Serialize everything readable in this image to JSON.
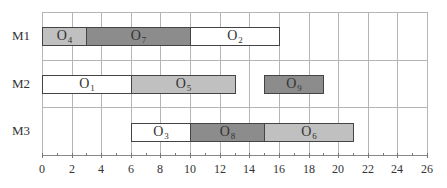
{
  "chart_data": {
    "type": "gantt",
    "title": "",
    "xlabel": "",
    "ylabel": "",
    "xlim": [
      0,
      26
    ],
    "x_ticks": [
      0,
      2,
      4,
      6,
      8,
      10,
      12,
      14,
      16,
      18,
      20,
      22,
      24,
      26
    ],
    "grid": true,
    "rows": [
      "M1",
      "M2",
      "M3"
    ],
    "tasks": [
      {
        "row": "M1",
        "op": "O",
        "sub": "4",
        "start": 0,
        "end": 3,
        "color": "#c0c0c0"
      },
      {
        "row": "M1",
        "op": "O",
        "sub": "7",
        "start": 3,
        "end": 10,
        "color": "#8c8c8c"
      },
      {
        "row": "M1",
        "op": "O",
        "sub": "2",
        "start": 10,
        "end": 16,
        "color": "#ffffff"
      },
      {
        "row": "M2",
        "op": "O",
        "sub": "1",
        "start": 0,
        "end": 6,
        "color": "#ffffff"
      },
      {
        "row": "M2",
        "op": "O",
        "sub": "5",
        "start": 6,
        "end": 13,
        "color": "#c0c0c0"
      },
      {
        "row": "M2",
        "op": "O",
        "sub": "9",
        "start": 15,
        "end": 19,
        "color": "#8c8c8c"
      },
      {
        "row": "M3",
        "op": "O",
        "sub": "3",
        "start": 6,
        "end": 10,
        "color": "#ffffff"
      },
      {
        "row": "M3",
        "op": "O",
        "sub": "8",
        "start": 10,
        "end": 15,
        "color": "#8c8c8c"
      },
      {
        "row": "M3",
        "op": "O",
        "sub": "6",
        "start": 15,
        "end": 21,
        "color": "#c0c0c0"
      }
    ]
  }
}
